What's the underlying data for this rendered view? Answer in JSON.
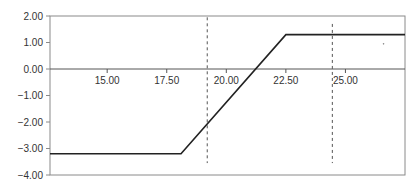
{
  "chart_data": {
    "type": "line",
    "title": "",
    "xlabel": "",
    "ylabel": "",
    "xlim": [
      12.6,
      27.5
    ],
    "ylim": [
      -4.0,
      2.0
    ],
    "grid": false,
    "legend": null,
    "x_ticks": [
      "15.00",
      "17.50",
      "20.00",
      "22.50",
      "25.00"
    ],
    "y_ticks": [
      "2.00",
      "1.00",
      "0.00",
      "-1.00",
      "-2.00",
      "-3.00",
      "-4.00"
    ],
    "series": [
      {
        "name": "payoff",
        "color": "#222222",
        "x": [
          12.6,
          18.1,
          22.5,
          27.5
        ],
        "y": [
          -3.2,
          -3.2,
          1.3,
          1.3
        ]
      }
    ],
    "reference_lines": [
      {
        "orientation": "vertical",
        "x": 19.2,
        "y_from": -3.55,
        "y_to": 1.95,
        "style": "dashed"
      },
      {
        "orientation": "vertical",
        "x": 24.45,
        "y_from": -3.55,
        "y_to": 1.7,
        "style": "dashed"
      }
    ],
    "annotations": [
      {
        "type": "dot",
        "x": 26.6,
        "y": 0.95
      }
    ]
  }
}
